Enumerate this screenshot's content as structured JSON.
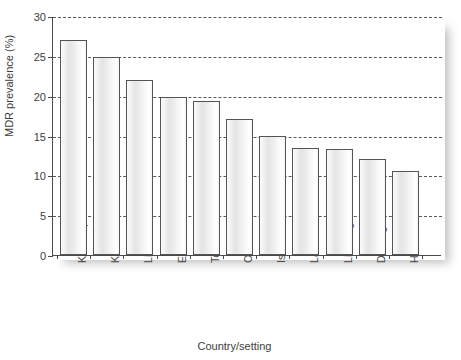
{
  "chart_data": {
    "type": "bar",
    "title": "",
    "xlabel": "Country/setting",
    "ylabel": "MDR prevalence (%)",
    "categories": [
      "Karakalpakstan",
      "Kazakhstan",
      "Lithuania",
      "Estonia",
      "Tomsk oblast",
      "Orel oblast",
      "Israel",
      "Latvia",
      "Liaoning",
      "Dashoguz",
      "Henan"
    ],
    "values": [
      27.0,
      24.9,
      22.0,
      19.8,
      19.3,
      17.1,
      15.0,
      13.4,
      13.3,
      12.1,
      10.6
    ],
    "ylim": [
      0,
      30
    ],
    "yticks": [
      0,
      5,
      10,
      15,
      20,
      25,
      30
    ],
    "ytick_labels": [
      "0",
      "5",
      "10",
      "15",
      "20",
      "25",
      "30"
    ],
    "grid": true,
    "grid_style": "dashed",
    "legend": null,
    "bar_edge_color": "#545458",
    "bar_fill_color": "#eeeeee",
    "axis_color": "#4a4a4a",
    "background_color": "#ffffff"
  }
}
